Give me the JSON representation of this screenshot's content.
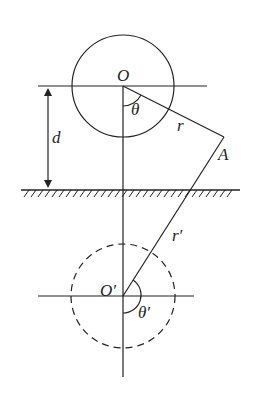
{
  "diagram": {
    "type": "image-method geometry (source and mirror image below a plane)",
    "labels": {
      "O": "O",
      "theta": "θ",
      "r": "r",
      "A": "A",
      "d": "d",
      "r_prime": "r′",
      "O_prime": "O′",
      "theta_prime": "θ′"
    },
    "elements": {
      "source_circle": {
        "center": [
          123,
          86
        ],
        "radius": 51,
        "style": "solid"
      },
      "image_circle": {
        "center": [
          123,
          296
        ],
        "radius": 52,
        "style": "dashed"
      },
      "ground_plane": {
        "y": 190,
        "x_from": 21,
        "x_to": 240,
        "hatched": true
      },
      "point_A": [
        224,
        137
      ],
      "distance_d": {
        "x": 48,
        "from_y": 86,
        "to_y": 190
      }
    },
    "colors": {
      "stroke": "#222222",
      "background": "#ffffff"
    }
  }
}
